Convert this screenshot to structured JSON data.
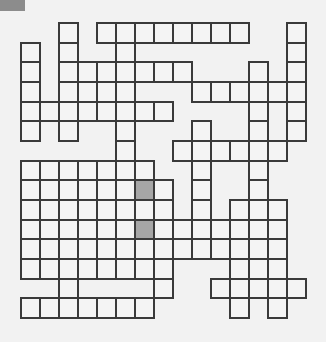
{
  "puzzle": {
    "type": "crossword",
    "cols": 15,
    "rows": 15,
    "cell_width": 19,
    "cell_height": 19.67,
    "colors": {
      "background": "#f2f2f2",
      "cell_fill": "#f4f4f4",
      "cell_border": "#3a3a3a",
      "shaded_cell": "#a6a6a6",
      "corner_tab": "#8c8c8c"
    },
    "cells_by_row": [
      [
        2,
        4,
        5,
        6,
        7,
        8,
        9,
        10,
        11,
        14
      ],
      [
        0,
        2,
        5,
        14
      ],
      [
        0,
        2,
        3,
        4,
        5,
        6,
        7,
        8,
        12,
        14
      ],
      [
        0,
        2,
        3,
        4,
        5,
        9,
        10,
        11,
        12,
        13,
        14
      ],
      [
        0,
        1,
        2,
        3,
        4,
        5,
        6,
        7,
        12,
        14
      ],
      [
        0,
        2,
        5,
        9,
        12,
        14
      ],
      [
        5,
        8,
        9,
        10,
        11,
        12,
        13
      ],
      [
        0,
        1,
        2,
        3,
        4,
        5,
        6,
        9,
        12
      ],
      [
        0,
        1,
        2,
        3,
        4,
        5,
        6,
        7,
        9,
        12
      ],
      [
        0,
        1,
        2,
        3,
        4,
        5,
        6,
        7,
        9,
        11,
        12,
        13
      ],
      [
        0,
        1,
        2,
        3,
        4,
        5,
        6,
        7,
        8,
        9,
        10,
        11,
        12,
        13
      ],
      [
        0,
        1,
        2,
        3,
        4,
        5,
        6,
        7,
        8,
        9,
        10,
        11,
        12,
        13
      ],
      [
        0,
        1,
        2,
        3,
        4,
        5,
        6,
        7,
        11,
        12,
        13
      ],
      [
        2,
        7,
        10,
        11,
        12,
        13,
        14
      ],
      [
        0,
        1,
        2,
        3,
        4,
        5,
        6,
        11,
        13
      ]
    ],
    "shaded_cells": [
      [
        8,
        6
      ],
      [
        10,
        6
      ]
    ]
  }
}
